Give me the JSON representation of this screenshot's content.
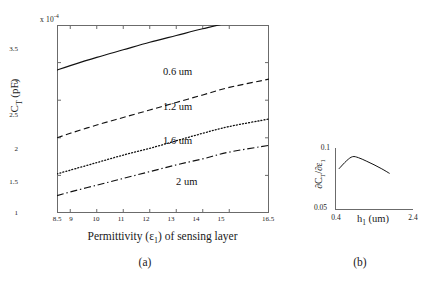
{
  "figure": {
    "panels": [
      {
        "id": "a",
        "caption": "(a)"
      },
      {
        "id": "b",
        "caption": "(b)"
      }
    ]
  },
  "panel_a": {
    "y_exponent_prefix": "x 10",
    "y_exponent": "-4",
    "ylabel_main": "C",
    "ylabel_sub": "T",
    "ylabel_unit": " (pF)",
    "xlabel_pre": "Permittivity (ε",
    "xlabel_sub": "1",
    "xlabel_post": ") of sensing layer",
    "y_ticks": [
      "3.5",
      "3",
      "2.5",
      "2",
      "1.5",
      "1"
    ],
    "x_ticks": [
      "8.5",
      "9",
      "10",
      "11",
      "12",
      "13",
      "14",
      "15",
      "16.5"
    ],
    "series_labels": [
      "0.6 um",
      "1.2 um",
      "1.6 um",
      "2 um"
    ]
  },
  "panel_b": {
    "ylabel": "∂C",
    "ylabel_sub1": "T",
    "ylabel_mid": "/∂ε",
    "ylabel_sub2": "1",
    "xlabel_pre": "h",
    "xlabel_sub": "1",
    "xlabel_post": " (um)",
    "y_ticks": [
      "0.1",
      "0.05"
    ],
    "x_ticks": [
      "0.4",
      "2.4"
    ]
  },
  "chart_data": [
    {
      "type": "line",
      "panel": "a",
      "title": "",
      "xlabel": "Permittivity (ε₁) of sensing layer",
      "ylabel": "C_T (pF)",
      "y_multiplier": "x 10^-4",
      "xlim": [
        8.5,
        16.5
      ],
      "ylim": [
        1,
        3.5
      ],
      "xticks": [
        8.5,
        9,
        10,
        11,
        12,
        13,
        14,
        15,
        16.5
      ],
      "yticks": [
        1,
        1.5,
        2,
        2.5,
        3,
        3.5
      ],
      "grid": false,
      "legend": "inline-annotations",
      "x": [
        8.5,
        9,
        10,
        11,
        12,
        13,
        14,
        15,
        16.5
      ],
      "series": [
        {
          "name": "0.6 um",
          "style": "solid",
          "values": [
            2.9,
            2.96,
            3.07,
            3.17,
            3.27,
            3.36,
            3.45,
            3.53,
            3.62
          ]
        },
        {
          "name": "1.2 um",
          "style": "dashed",
          "values": [
            2.0,
            2.06,
            2.17,
            2.27,
            2.37,
            2.47,
            2.57,
            2.67,
            2.78
          ]
        },
        {
          "name": "1.6 um",
          "style": "dotted",
          "values": [
            1.52,
            1.57,
            1.67,
            1.77,
            1.86,
            1.96,
            2.06,
            2.15,
            2.25
          ]
        },
        {
          "name": "2 um",
          "style": "dashdot",
          "values": [
            1.23,
            1.28,
            1.37,
            1.46,
            1.55,
            1.64,
            1.72,
            1.81,
            1.9
          ]
        }
      ]
    },
    {
      "type": "line",
      "panel": "b",
      "title": "",
      "xlabel": "h₁ (um)",
      "ylabel": "∂C_T/∂ε₁",
      "xlim": [
        0.4,
        2.4
      ],
      "ylim": [
        0.05,
        0.1
      ],
      "xticks": [
        0.4,
        2.4
      ],
      "yticks": [
        0.05,
        0.1
      ],
      "grid": false,
      "x": [
        0.5,
        0.7,
        0.85,
        1.0,
        1.2,
        1.4,
        1.6,
        1.8
      ],
      "values": [
        0.0832,
        0.0898,
        0.093,
        0.0922,
        0.0895,
        0.0865,
        0.0832,
        0.0795
      ]
    }
  ]
}
